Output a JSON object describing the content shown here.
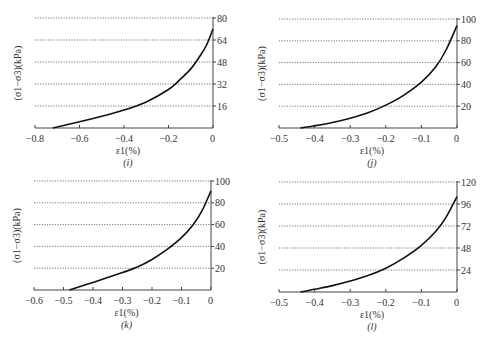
{
  "chart_data": [
    {
      "id": "i",
      "type": "line",
      "caption": "(i)",
      "xlabel": "ε1(%)",
      "ylabel": "(σ1−σ3)(kPa)",
      "xlim": [
        -0.8,
        0
      ],
      "ylim": [
        0,
        80
      ],
      "xticks": [
        -0.8,
        -0.6,
        -0.4,
        -0.2,
        0
      ],
      "xtick_labels": [
        "−0.8",
        "−0.6",
        "−0.4",
        "−0.2",
        "0"
      ],
      "yticks": [
        0,
        16,
        32,
        48,
        64,
        80
      ],
      "ytick_labels": [
        "0",
        "16",
        "32",
        "48",
        "64",
        "80"
      ],
      "y_axis_position": "right",
      "grid": "horizontal dotted",
      "x": [
        -0.72,
        -0.6,
        -0.5,
        -0.4,
        -0.3,
        -0.2,
        -0.15,
        -0.1,
        -0.06,
        -0.03,
        0
      ],
      "y": [
        0,
        4.5,
        8.5,
        13,
        19,
        28,
        35,
        43,
        52,
        60,
        72
      ]
    },
    {
      "id": "j",
      "type": "line",
      "caption": "(j)",
      "xlabel": "ε1(%)",
      "ylabel": "(σ1−σ3)(kPa)",
      "xlim": [
        -0.5,
        0
      ],
      "ylim": [
        0,
        100
      ],
      "xticks": [
        -0.5,
        -0.4,
        -0.3,
        -0.2,
        -0.1,
        0
      ],
      "xtick_labels": [
        "−0.5",
        "−0.4",
        "−0.3",
        "−0.2",
        "−0.1",
        "0"
      ],
      "yticks": [
        0,
        20,
        40,
        60,
        80,
        100
      ],
      "ytick_labels": [
        "0",
        "20",
        "40",
        "60",
        "80",
        "100"
      ],
      "y_axis_position": "right",
      "grid": "horizontal dotted",
      "x": [
        -0.44,
        -0.4,
        -0.35,
        -0.3,
        -0.25,
        -0.2,
        -0.15,
        -0.1,
        -0.06,
        -0.03,
        0
      ],
      "y": [
        0,
        2,
        5,
        9,
        14,
        21,
        30,
        42,
        56,
        72,
        94
      ]
    },
    {
      "id": "k",
      "type": "line",
      "caption": "(k)",
      "xlabel": "ε1(%)",
      "ylabel": "(σ1−σ3)(kPa)",
      "xlim": [
        -0.6,
        0
      ],
      "ylim": [
        0,
        100
      ],
      "xticks": [
        -0.6,
        -0.5,
        -0.4,
        -0.3,
        -0.2,
        -0.1,
        0
      ],
      "xtick_labels": [
        "−0.6",
        "−0.5",
        "−0.4",
        "−0.3",
        "−0.2",
        "−0.1",
        "0"
      ],
      "yticks": [
        0,
        20,
        40,
        60,
        80,
        100
      ],
      "ytick_labels": [
        "0",
        "20",
        "40",
        "60",
        "80",
        "100"
      ],
      "y_axis_position": "right",
      "grid": "horizontal dotted",
      "x": [
        -0.48,
        -0.4,
        -0.3,
        -0.25,
        -0.2,
        -0.15,
        -0.1,
        -0.06,
        -0.03,
        0
      ],
      "y": [
        0,
        7,
        16,
        21,
        28,
        37,
        48,
        60,
        73,
        91
      ]
    },
    {
      "id": "l",
      "type": "line",
      "caption": "(l)",
      "xlabel": "ε1(%)",
      "ylabel": "(σ1−σ3)(kPa)",
      "xlim": [
        -0.5,
        0
      ],
      "ylim": [
        0,
        120
      ],
      "xticks": [
        -0.5,
        -0.4,
        -0.3,
        -0.2,
        -0.1,
        0
      ],
      "xtick_labels": [
        "−0.5",
        "−0.4",
        "−0.3",
        "−0.2",
        "−0.1",
        "0"
      ],
      "yticks": [
        0,
        24,
        48,
        72,
        96,
        120
      ],
      "ytick_labels": [
        "0",
        "24",
        "48",
        "72",
        "96",
        "120"
      ],
      "y_axis_position": "right",
      "grid": "horizontal dotted",
      "x": [
        -0.44,
        -0.4,
        -0.35,
        -0.3,
        -0.25,
        -0.2,
        -0.15,
        -0.1,
        -0.06,
        -0.03,
        0
      ],
      "y": [
        0,
        3,
        7,
        12,
        18,
        26,
        37,
        51,
        66,
        82,
        104
      ]
    }
  ],
  "layout": [
    {
      "x0": 35,
      "x1": 213,
      "y0": 128,
      "ytop": 18
    },
    {
      "x0": 279,
      "x1": 457,
      "y0": 128,
      "ytop": 19
    },
    {
      "x0": 34,
      "x1": 211,
      "y0": 290,
      "ytop": 181
    },
    {
      "x0": 279,
      "x1": 457,
      "y0": 292,
      "ytop": 182
    }
  ]
}
